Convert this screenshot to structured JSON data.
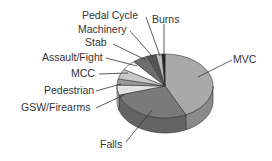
{
  "chart_data": {
    "type": "pie",
    "style": "3d-exploded-none",
    "title": "",
    "categories": [
      "MVC",
      "Falls",
      "GSW/Firearms",
      "Pedestrian",
      "MCC",
      "Assault/Fight",
      "Stab",
      "Machinery",
      "Pedal Cycle",
      "Burns"
    ],
    "values": [
      42,
      27,
      5,
      3,
      5,
      5,
      5,
      3,
      2,
      1
    ],
    "unit": "percent (estimated)",
    "colors": [
      "#a9a9a9",
      "#7a7a7a",
      "#e2e2e2",
      "#9a9a9a",
      "#c8c8c8",
      "#ffffff",
      "#6e6e6e",
      "#555555",
      "#bcbcbc",
      "#222222"
    ],
    "legend": "none (callout labels)"
  },
  "labels": {
    "mvc": "MVC",
    "falls": "Falls",
    "gsw": "GSW/Firearms",
    "pedestrian": "Pedestrian",
    "mcc": "MCC",
    "assault": "Assault/Fight",
    "stab": "Stab",
    "machinery": "Machinery",
    "pedal": "Pedal Cycle",
    "burns": "Burns"
  }
}
